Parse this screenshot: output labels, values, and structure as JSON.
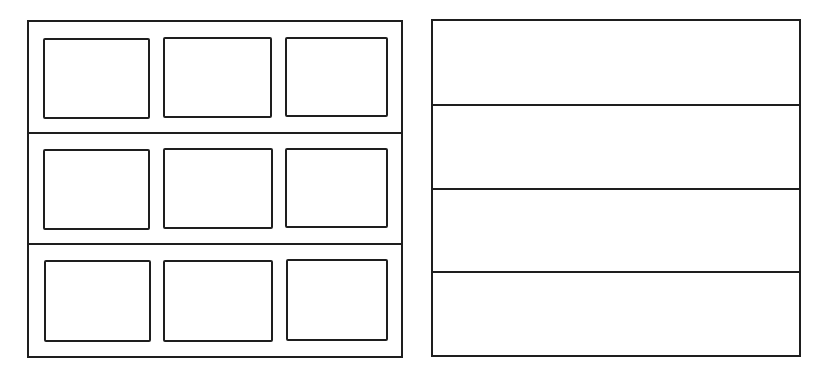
{
  "diagram": {
    "stroke_color": "#1e1e1e",
    "background": "#ffffff",
    "left_panel": {
      "description": "3x3 grid of framed cells inside a frame divided into 3 rows",
      "frame": {
        "x": 27,
        "y": 20,
        "w": 376,
        "h": 338
      },
      "row_dividers_y": [
        133,
        244
      ],
      "rows": [
        {
          "cells": [
            {
              "x": 43,
              "y": 38,
              "w": 107,
              "h": 81
            },
            {
              "x": 163,
              "y": 37,
              "w": 109,
              "h": 81
            },
            {
              "x": 285,
              "y": 37,
              "w": 103,
              "h": 80
            }
          ]
        },
        {
          "cells": [
            {
              "x": 43,
              "y": 149,
              "w": 107,
              "h": 81
            },
            {
              "x": 163,
              "y": 148,
              "w": 110,
              "h": 81
            },
            {
              "x": 285,
              "y": 148,
              "w": 103,
              "h": 80
            }
          ]
        },
        {
          "cells": [
            {
              "x": 44,
              "y": 260,
              "w": 107,
              "h": 82
            },
            {
              "x": 163,
              "y": 260,
              "w": 110,
              "h": 82
            },
            {
              "x": 286,
              "y": 259,
              "w": 102,
              "h": 82
            }
          ]
        }
      ]
    },
    "right_panel": {
      "description": "Frame divided into 4 horizontal bands",
      "frame": {
        "x": 431,
        "y": 19,
        "w": 370,
        "h": 338
      },
      "row_dividers_y": [
        105,
        189,
        272
      ]
    }
  }
}
